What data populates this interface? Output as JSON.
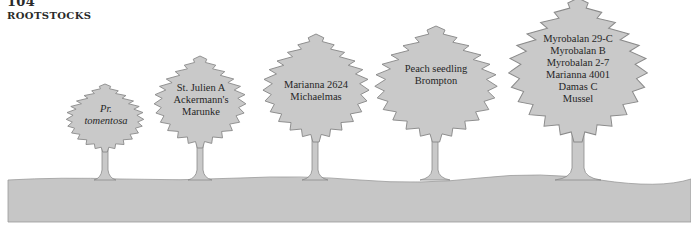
{
  "page": {
    "number": "104",
    "running_head": "ROOTSTOCKS"
  },
  "colors": {
    "canopy": "#c9c9c9",
    "outline": "#8a8a8a",
    "ground": "#c6c6c6",
    "text": "#262626"
  },
  "figure": {
    "trees": [
      {
        "labels": [
          "Pr.",
          "tomentosa"
        ],
        "italic": true
      },
      {
        "labels": [
          "St. Julien A",
          "Ackermann's",
          "Marunke"
        ],
        "italic": false
      },
      {
        "labels": [
          "Marianna 2624",
          "Michaelmas"
        ],
        "italic": false
      },
      {
        "labels": [
          "Peach seedling",
          "Brompton"
        ],
        "italic": false
      },
      {
        "labels": [
          "Myrobalan 29-C",
          "Myrobalan B",
          "Myrobalan 2-7",
          "Marianna 4001",
          "Damas C",
          "Mussel"
        ],
        "italic": false
      }
    ]
  }
}
